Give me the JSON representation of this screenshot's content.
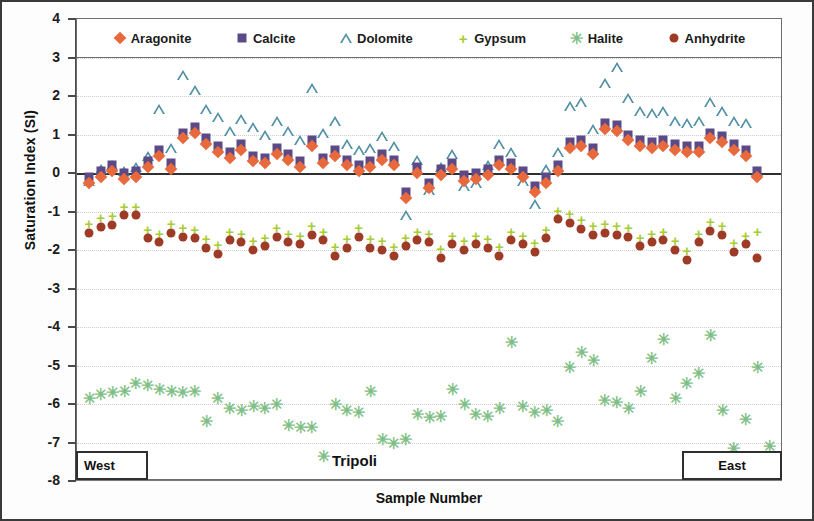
{
  "chart_data": {
    "type": "scatter",
    "title": "",
    "xlabel": "Sample Number",
    "ylabel": "Saturation Index (SI)",
    "ylim": [
      -8,
      4
    ],
    "yticks": [
      4,
      3,
      2,
      1,
      0,
      -1,
      -2,
      -3,
      -4,
      -5,
      -6,
      -7,
      -8
    ],
    "grid": true,
    "legend_position": "top-inside",
    "annotations": [
      {
        "text": "West",
        "position": "bottom-left",
        "boxed": true
      },
      {
        "text": "Tripoli",
        "position": "bottom-center",
        "boxed": false
      },
      {
        "text": "East",
        "position": "bottom-right",
        "boxed": true
      }
    ],
    "colors": {
      "aragonite": "#e8693c",
      "calcite": "#5b4a87",
      "dolomite": "#4e8fa3",
      "gypsum": "#a8cc34",
      "halite": "#7fbf86",
      "anhydrite": "#9e3b26"
    },
    "series": [
      {
        "name": "Aragonite",
        "marker": "diamond",
        "color": "#e8693c",
        "values": [
          -0.25,
          -0.1,
          0.05,
          -0.15,
          -0.1,
          0.15,
          0.45,
          0.1,
          0.9,
          1.05,
          0.75,
          0.55,
          0.4,
          0.6,
          0.3,
          0.25,
          0.5,
          0.35,
          0.15,
          0.7,
          0.25,
          0.45,
          0.2,
          0.05,
          0.15,
          0.35,
          0.2,
          -0.65,
          0.0,
          -0.4,
          -0.05,
          0.1,
          -0.2,
          -0.15,
          -0.05,
          0.2,
          0.1,
          -0.1,
          -0.5,
          -0.25,
          0.05,
          0.65,
          0.7,
          0.5,
          1.15,
          1.1,
          0.85,
          0.7,
          0.65,
          0.7,
          0.6,
          0.55,
          0.55,
          0.9,
          0.8,
          0.6,
          0.45,
          -0.1
        ]
      },
      {
        "name": "Calcite",
        "marker": "square",
        "color": "#5b4a87",
        "values": [
          -0.1,
          0.05,
          0.2,
          0.0,
          0.05,
          0.3,
          0.6,
          0.25,
          1.05,
          1.2,
          0.9,
          0.7,
          0.55,
          0.75,
          0.45,
          0.4,
          0.65,
          0.5,
          0.3,
          0.85,
          0.4,
          0.6,
          0.35,
          0.2,
          0.3,
          0.5,
          0.35,
          -0.5,
          0.15,
          -0.25,
          0.1,
          0.25,
          -0.05,
          0.0,
          0.1,
          0.35,
          0.25,
          0.05,
          -0.35,
          -0.1,
          0.2,
          0.8,
          0.85,
          0.65,
          1.3,
          1.25,
          1.0,
          0.85,
          0.8,
          0.85,
          0.75,
          0.7,
          0.7,
          1.05,
          0.95,
          0.75,
          0.6,
          0.05
        ]
      },
      {
        "name": "Dolomite",
        "marker": "triangle",
        "color": "#4e8fa3",
        "values": [
          -0.2,
          0.1,
          0.2,
          0.05,
          0.15,
          0.45,
          1.65,
          0.65,
          2.55,
          2.15,
          1.65,
          1.45,
          1.1,
          1.4,
          1.2,
          1.0,
          1.35,
          1.1,
          0.85,
          2.2,
          1.05,
          1.35,
          0.75,
          0.6,
          0.65,
          0.95,
          0.7,
          -1.1,
          0.35,
          -0.45,
          0.15,
          0.5,
          -0.35,
          -0.25,
          0.2,
          0.75,
          0.55,
          -0.2,
          -0.8,
          0.1,
          0.55,
          1.75,
          1.85,
          1.15,
          2.35,
          2.75,
          1.95,
          1.6,
          1.55,
          1.6,
          1.35,
          1.3,
          1.35,
          1.85,
          1.6,
          1.35,
          1.3,
          0.05
        ]
      },
      {
        "name": "Gypsum",
        "marker": "plus",
        "color": "#a8cc34",
        "values": [
          -1.3,
          -1.15,
          -1.1,
          -0.85,
          -0.85,
          -1.45,
          -1.55,
          -1.3,
          -1.4,
          -1.45,
          -1.7,
          -1.85,
          -1.5,
          -1.55,
          -1.75,
          -1.65,
          -1.4,
          -1.55,
          -1.6,
          -1.35,
          -1.5,
          -1.9,
          -1.7,
          -1.4,
          -1.7,
          -1.75,
          -1.9,
          -1.65,
          -1.5,
          -1.55,
          -1.95,
          -1.6,
          -1.75,
          -1.6,
          -1.7,
          -1.9,
          -1.5,
          -1.6,
          -1.8,
          -1.45,
          -0.95,
          -1.05,
          -1.2,
          -1.35,
          -1.3,
          -1.35,
          -1.4,
          -1.65,
          -1.55,
          -1.5,
          -1.75,
          -2.0,
          -1.55,
          -1.25,
          -1.35,
          -1.8,
          -1.6,
          -1.5
        ]
      },
      {
        "name": "Halite",
        "marker": "star",
        "color": "#7fbf86",
        "values": [
          -5.85,
          -5.75,
          -5.7,
          -5.65,
          -5.45,
          -5.5,
          -5.6,
          -5.65,
          -5.7,
          -5.65,
          -6.45,
          -5.85,
          -6.1,
          -6.15,
          -6.05,
          -6.1,
          -6.0,
          -6.55,
          -6.6,
          -6.6,
          -7.35,
          -6.0,
          -6.15,
          -6.2,
          -5.65,
          -6.9,
          -7.0,
          -6.9,
          -6.25,
          -6.35,
          -6.3,
          -5.6,
          -6.0,
          -6.25,
          -6.3,
          -6.1,
          -4.4,
          -6.05,
          -6.2,
          -6.15,
          -6.45,
          -5.05,
          -4.65,
          -4.85,
          -5.9,
          -5.95,
          -6.1,
          -5.65,
          -4.8,
          -4.3,
          -5.85,
          -5.45,
          -5.2,
          -4.2,
          -6.15,
          -7.15,
          -6.4,
          -5.05,
          -7.1
        ]
      },
      {
        "name": "Anhydrite",
        "marker": "circle",
        "color": "#9e3b26",
        "values": [
          -1.55,
          -1.4,
          -1.35,
          -1.1,
          -1.1,
          -1.7,
          -1.8,
          -1.55,
          -1.65,
          -1.7,
          -1.95,
          -2.1,
          -1.75,
          -1.8,
          -2.0,
          -1.9,
          -1.65,
          -1.8,
          -1.85,
          -1.6,
          -1.75,
          -2.15,
          -1.95,
          -1.65,
          -1.95,
          -2.0,
          -2.15,
          -1.9,
          -1.75,
          -1.8,
          -2.2,
          -1.85,
          -2.0,
          -1.85,
          -1.95,
          -2.15,
          -1.75,
          -1.85,
          -2.05,
          -1.7,
          -1.2,
          -1.3,
          -1.45,
          -1.6,
          -1.55,
          -1.6,
          -1.65,
          -1.9,
          -1.8,
          -1.75,
          -2.0,
          -2.25,
          -1.8,
          -1.5,
          -1.6,
          -2.05,
          -1.85,
          -2.2
        ]
      }
    ]
  },
  "axis": {
    "y_title": "Saturation Index (SI)",
    "x_title": "Sample Number",
    "y_labels": [
      "4",
      "3",
      "2",
      "1",
      "0",
      "-1",
      "-2",
      "-3",
      "-4",
      "-5",
      "-6",
      "-7",
      "-8"
    ]
  },
  "legend": {
    "items": [
      {
        "label": "Aragonite",
        "marker": "diamond",
        "icon": "diamond-marker-icon"
      },
      {
        "label": "Calcite",
        "marker": "square",
        "icon": "square-marker-icon"
      },
      {
        "label": "Dolomite",
        "marker": "triangle",
        "icon": "triangle-marker-icon"
      },
      {
        "label": "Gypsum",
        "marker": "plus",
        "icon": "plus-marker-icon"
      },
      {
        "label": "Halite",
        "marker": "star",
        "icon": "star-marker-icon"
      },
      {
        "label": "Anhydrite",
        "marker": "circle",
        "icon": "circle-marker-icon"
      }
    ]
  },
  "regions": {
    "west": "West",
    "center": "Tripoli",
    "east": "East"
  }
}
